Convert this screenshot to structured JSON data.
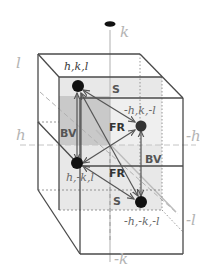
{
  "diagram": {
    "axes": {
      "k_pos": "k",
      "k_neg": "-k",
      "h_pos": "h",
      "h_neg": "-h",
      "l_pos": "l",
      "l_neg": "-l"
    },
    "points": [
      {
        "id": "p1",
        "label": "h,k,l"
      },
      {
        "id": "p2",
        "label": "-h,k,-l"
      },
      {
        "id": "p3",
        "label": "h,-k,l"
      },
      {
        "id": "p4",
        "label": "-h,-k,-l"
      }
    ],
    "operations": {
      "s_top": "S",
      "s_bottom": "S",
      "fr_top": "FR",
      "fr_bottom": "FR",
      "bv_left": "BV",
      "bv_right": "BV"
    },
    "colors": {
      "edge": "#4a4a4a",
      "axis": "#bcbcbc",
      "shade_dark": "#c8c8c8",
      "shade_light": "#e6e6e6",
      "point": "#111111",
      "arrow": "#555555"
    }
  }
}
